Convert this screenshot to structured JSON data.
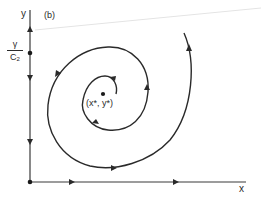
{
  "figure": {
    "panel_label": "(b)",
    "axes": {
      "x_label": "x",
      "y_label": "y"
    },
    "y_axis_marker": {
      "numerator": "γ",
      "denominator_base": "C",
      "denominator_sub": "2"
    },
    "fixed_point_label": "(x*, y*)",
    "colors": {
      "line": "#2a2a2a",
      "background": "#ffffff"
    }
  }
}
